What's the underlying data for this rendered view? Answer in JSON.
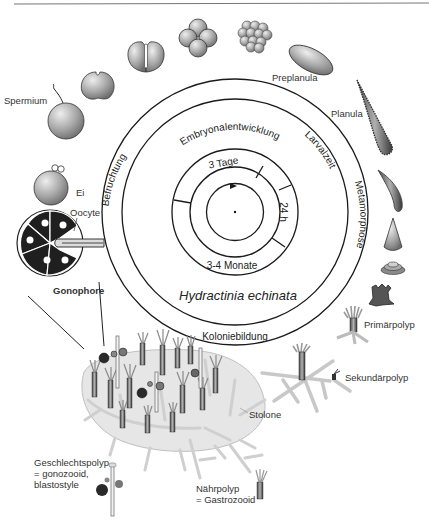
{
  "diagram": {
    "title": "Hydractinia echinata",
    "outer_ring_labels": {
      "top": "Embryonalentwicklung",
      "left": "Befruchtung",
      "right_upper": "Larvalzeit",
      "right": "Metamorphose",
      "bottom": "Koloniebildung"
    },
    "inner_ring_labels": {
      "top": "3 Tage",
      "right": "24 h",
      "bottom": "3-4 Monate"
    },
    "stage_labels": {
      "spermium": "Spermium",
      "ei": "Ei",
      "preplanula": "Preplanula",
      "planula": "Planula",
      "oocyte": "Oocyte",
      "gonophore": "Gonophore",
      "primaerpolyp": "Primärpolyp",
      "sekundaerpolyp": "Sekundärpolyp",
      "stolone": "Stolone",
      "geschlechtspolyp_1": "Geschlechtspolyp",
      "geschlechtspolyp_2": "= gonozooid,",
      "geschlechtspolyp_3": "blastostyle",
      "naehrpolyp_1": "Nährpolyp",
      "naehrpolyp_2": "= Gastrozooid"
    },
    "colors": {
      "line": "#1a1a1a",
      "cell_gray": "#9a9a9a",
      "cell_light": "#d6d6d6",
      "dark": "#2a2a2a",
      "colony_bg": "#e4e4e4"
    }
  }
}
